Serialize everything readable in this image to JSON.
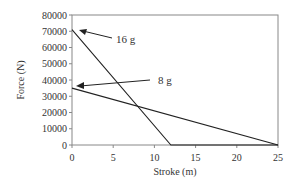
{
  "chart_data": {
    "type": "line",
    "title": "",
    "xlabel": "Stroke (m)",
    "ylabel": "Force (N)",
    "xlim": [
      0,
      25
    ],
    "ylim": [
      0,
      80000
    ],
    "x_ticks": [
      0,
      5,
      10,
      15,
      20,
      25
    ],
    "y_ticks": [
      0,
      10000,
      20000,
      30000,
      40000,
      50000,
      60000,
      70000,
      80000
    ],
    "grid": false,
    "series": [
      {
        "name": "16 g",
        "x": [
          0,
          12,
          25
        ],
        "y": [
          71000,
          0,
          0
        ]
      },
      {
        "name": "8 g",
        "x": [
          0,
          25
        ],
        "y": [
          35000,
          0
        ]
      }
    ],
    "annotations": [
      {
        "text": "16 g",
        "points_to": [
          0.5,
          70000
        ]
      },
      {
        "text": "8 g",
        "points_to": [
          0.5,
          35000
        ]
      }
    ]
  },
  "labels": {
    "xlabel": "Stroke (m)",
    "ylabel": "Force (N)",
    "ann16": "16 g",
    "ann8": "8 g"
  }
}
